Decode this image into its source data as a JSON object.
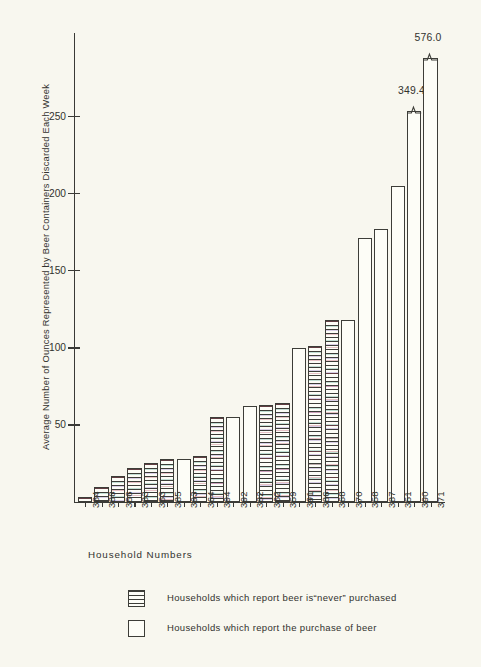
{
  "chart_data": {
    "type": "bar",
    "title": "",
    "xlabel": "Household  Numbers",
    "ylabel": "Average Number of Ounces Represented by Beer Containers Discarded Each Week",
    "ylim": [
      0,
      290
    ],
    "yticks": [
      50,
      100,
      150,
      200,
      250
    ],
    "ytick_labels": [
      "50",
      "100",
      "150",
      "200",
      "250"
    ],
    "grid": false,
    "legend_position": "bottom-center",
    "categories": [
      "384",
      "388",
      "356",
      "383",
      "353",
      "385",
      "393",
      "364",
      "394",
      "392",
      "382",
      "362",
      "359",
      "391",
      "386",
      "368",
      "370",
      "358",
      "387",
      "351",
      "390",
      "371"
    ],
    "values": [
      3,
      10,
      17,
      22,
      25,
      28,
      28,
      30,
      55,
      55,
      62,
      63,
      64,
      100,
      101,
      118,
      118,
      171,
      177,
      205,
      349.4,
      576.0
    ],
    "bar_groups": [
      {
        "category": "384",
        "value": 3,
        "series": "never",
        "axis_display_value": 3,
        "truncated": false,
        "value_label": ""
      },
      {
        "category": "388",
        "value": 10,
        "series": "never",
        "axis_display_value": 10,
        "truncated": false,
        "value_label": ""
      },
      {
        "category": "356",
        "value": 17,
        "series": "never",
        "axis_display_value": 17,
        "truncated": false,
        "value_label": ""
      },
      {
        "category": "383",
        "value": 22,
        "series": "never",
        "axis_display_value": 22,
        "truncated": false,
        "value_label": ""
      },
      {
        "category": "353",
        "value": 25,
        "series": "never",
        "axis_display_value": 25,
        "truncated": false,
        "value_label": ""
      },
      {
        "category": "385",
        "value": 28,
        "series": "never",
        "axis_display_value": 28,
        "truncated": false,
        "value_label": ""
      },
      {
        "category": "393",
        "value": 28,
        "series": "purchase",
        "axis_display_value": 28,
        "truncated": false,
        "value_label": ""
      },
      {
        "category": "364",
        "value": 30,
        "series": "never",
        "axis_display_value": 30,
        "truncated": false,
        "value_label": ""
      },
      {
        "category": "394",
        "value": 55,
        "series": "never",
        "axis_display_value": 55,
        "truncated": false,
        "value_label": ""
      },
      {
        "category": "392",
        "value": 55,
        "series": "purchase",
        "axis_display_value": 55,
        "truncated": false,
        "value_label": ""
      },
      {
        "category": "382",
        "value": 62,
        "series": "purchase",
        "axis_display_value": 62,
        "truncated": false,
        "value_label": ""
      },
      {
        "category": "362",
        "value": 63,
        "series": "never",
        "axis_display_value": 63,
        "truncated": false,
        "value_label": ""
      },
      {
        "category": "359",
        "value": 64,
        "series": "never",
        "axis_display_value": 64,
        "truncated": false,
        "value_label": ""
      },
      {
        "category": "391",
        "value": 100,
        "series": "purchase",
        "axis_display_value": 100,
        "truncated": false,
        "value_label": ""
      },
      {
        "category": "386",
        "value": 101,
        "series": "never",
        "axis_display_value": 101,
        "truncated": false,
        "value_label": ""
      },
      {
        "category": "368",
        "value": 118,
        "series": "never",
        "axis_display_value": 118,
        "truncated": false,
        "value_label": ""
      },
      {
        "category": "370",
        "value": 118,
        "series": "purchase",
        "axis_display_value": 118,
        "truncated": false,
        "value_label": ""
      },
      {
        "category": "358",
        "value": 171,
        "series": "purchase",
        "axis_display_value": 171,
        "truncated": false,
        "value_label": ""
      },
      {
        "category": "387",
        "value": 177,
        "series": "purchase",
        "axis_display_value": 177,
        "truncated": false,
        "value_label": ""
      },
      {
        "category": "351",
        "value": 205,
        "series": "purchase",
        "axis_display_value": 205,
        "truncated": false,
        "value_label": ""
      },
      {
        "category": "390",
        "value": 349.4,
        "series": "purchase",
        "axis_display_value": 254,
        "truncated": true,
        "value_label": "349.4"
      },
      {
        "category": "371",
        "value": 576.0,
        "series": "purchase",
        "axis_display_value": 288,
        "truncated": true,
        "value_label": "576.0"
      }
    ],
    "annotations": [
      {
        "text": "349.4",
        "category": "390",
        "note": "axis-break callout above truncated bar"
      },
      {
        "text": "576.0",
        "category": "371",
        "note": "axis-break callout above truncated bar"
      }
    ],
    "legend": [
      {
        "key": "never",
        "swatch": "hatched",
        "label": "Households which report beer is“never” purchased"
      },
      {
        "key": "purchase",
        "swatch": "open",
        "label": "Households which report the purchase of beer"
      }
    ]
  }
}
